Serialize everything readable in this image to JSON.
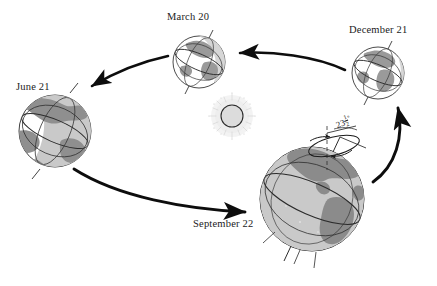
{
  "figure": {
    "background_color": "#ffffff",
    "ink_color": "#1b1b1b"
  },
  "sun": {
    "name": "Sun",
    "fill_color": "#d8d8d8",
    "outline_color": "#2b2b2b",
    "corona_color": "#b8b8b8",
    "center_x": 232,
    "center_y": 116,
    "radius": 11
  },
  "tilt_annotation": {
    "whole": "23",
    "numerator": "1",
    "denominator": "2",
    "degree_symbol": "°",
    "value_degrees": 23.5,
    "meaning": "axial tilt of Earth's rotation axis from the orbital plane normal"
  },
  "positions": [
    {
      "id": "march",
      "label": "March 20",
      "season_event": "vernal equinox",
      "center_x": 199,
      "center_y": 62,
      "radius": 26,
      "axis_tilt_deg": 23.5,
      "ocean_color": "#e4e4e4",
      "land_color": "#9a9a9a",
      "lit_color": "#ffffff",
      "outline_color": "#2b2b2b"
    },
    {
      "id": "december",
      "label": "December 21",
      "season_event": "winter solstice",
      "center_x": 378,
      "center_y": 73,
      "radius": 26,
      "axis_tilt_deg": 23.5,
      "ocean_color": "#e4e4e4",
      "land_color": "#9a9a9a",
      "lit_color": "#ffffff",
      "outline_color": "#2b2b2b"
    },
    {
      "id": "june",
      "label": "June 21",
      "season_event": "summer solstice",
      "center_x": 55,
      "center_y": 131,
      "radius": 36,
      "axis_tilt_deg": 23.5,
      "ocean_color": "#c9c9c9",
      "land_color": "#8f8f8f",
      "lit_color": "#ffffff",
      "outline_color": "#2b2b2b"
    },
    {
      "id": "september",
      "label": "September 22",
      "season_event": "autumnal equinox",
      "center_x": 312,
      "center_y": 199,
      "radius": 52,
      "axis_tilt_deg": 23.5,
      "ocean_color": "#c9c9c9",
      "land_color": "#8b8b8b",
      "lit_color": "#ffffff",
      "outline_color": "#2b2b2b"
    }
  ],
  "orbit_arrows": [
    {
      "id": "december-to-march",
      "from": "December 21",
      "to": "March 20",
      "direction": "leftward"
    },
    {
      "id": "march-to-june",
      "from": "March 20",
      "to": "June 21",
      "direction": "down-left"
    },
    {
      "id": "june-to-september",
      "from": "June 21",
      "to": "September 22",
      "direction": "down-right"
    },
    {
      "id": "september-to-december",
      "from": "September 22",
      "to": "December 21",
      "direction": "upward"
    }
  ],
  "orbit_direction": "counterclockwise"
}
